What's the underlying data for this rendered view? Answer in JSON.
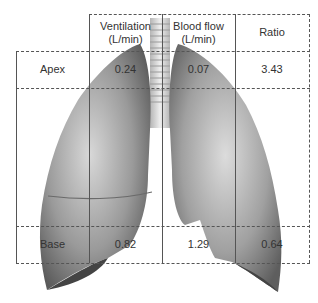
{
  "table": {
    "columns": [
      {
        "line1": "Ventilation",
        "line2": "(L/min)"
      },
      {
        "line1": "Blood flow",
        "line2": "(L/min)"
      },
      {
        "line1": "Ratio",
        "line2": ""
      }
    ],
    "rows": [
      {
        "label": "Apex",
        "ventilation": "0.24",
        "blood_flow": "0.07",
        "ratio": "3.43"
      },
      {
        "label": "Base",
        "ventilation": "0.82",
        "blood_flow": "1.29",
        "ratio": "0.64"
      }
    ]
  },
  "illustration": {
    "subject": "lungs-with-trachea",
    "style": "grayscale"
  }
}
